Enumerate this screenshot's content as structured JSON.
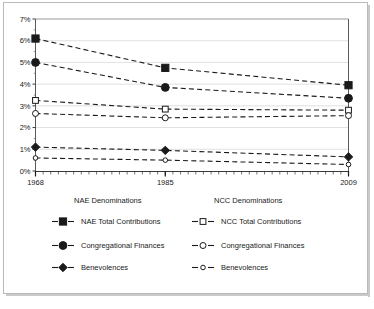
{
  "chart_data": {
    "type": "line",
    "title": "",
    "subtitle": "",
    "xlabel": "",
    "ylabel": "",
    "x": [
      1968,
      1985,
      2009
    ],
    "xtick_labels": [
      "1968",
      "1985",
      "2009"
    ],
    "xlim": [
      1968,
      2009
    ],
    "ylim": [
      0,
      7
    ],
    "ytick_labels": [
      "0%",
      "1%",
      "2%",
      "3%",
      "4%",
      "5%",
      "6%",
      "7%"
    ],
    "ytick_values": [
      0,
      1,
      2,
      3,
      4,
      5,
      6,
      7
    ],
    "grid": true,
    "grid_axis": "y",
    "legend_position": "below",
    "minor_ticks_x": "annual",
    "series": [
      {
        "name": "NAE Total Contributions",
        "group": "NAE Denominations",
        "marker": "filled-square",
        "linestyle": "dashed",
        "color": "#1a1a1a",
        "values": [
          6.1,
          4.75,
          3.95
        ]
      },
      {
        "name": "Congregational Finances",
        "group": "NAE Denominations",
        "marker": "filled-circle",
        "linestyle": "dashed",
        "color": "#1a1a1a",
        "values": [
          5.0,
          3.85,
          3.35
        ]
      },
      {
        "name": "Benevolences",
        "group": "NAE Denominations",
        "marker": "filled-diamond",
        "linestyle": "dashed",
        "color": "#1a1a1a",
        "values": [
          1.1,
          0.95,
          0.65
        ]
      },
      {
        "name": "NCC Total Contributions",
        "group": "NCC Denominations",
        "marker": "open-square",
        "linestyle": "dashed",
        "color": "#1a1a1a",
        "values": [
          3.25,
          2.85,
          2.8
        ]
      },
      {
        "name": "Congregational Finances",
        "group": "NCC Denominations",
        "marker": "open-circle",
        "linestyle": "dashed",
        "color": "#1a1a1a",
        "values": [
          2.65,
          2.45,
          2.55
        ]
      },
      {
        "name": "Benevolences",
        "group": "NCC Denominations",
        "marker": "open-circle-small",
        "linestyle": "dashed",
        "color": "#1a1a1a",
        "values": [
          0.6,
          0.5,
          0.3
        ]
      }
    ]
  },
  "legend": {
    "columns": [
      {
        "heading": "NAE Denominations",
        "entries": [
          {
            "label": "NAE Total Contributions",
            "marker": "filled-square"
          },
          {
            "label": "Congregational Finances",
            "marker": "filled-circle"
          },
          {
            "label": "Benevolences",
            "marker": "filled-diamond"
          }
        ]
      },
      {
        "heading": "NCC Denominations",
        "entries": [
          {
            "label": "NCC Total Contributions",
            "marker": "open-square"
          },
          {
            "label": "Congregational Finances",
            "marker": "open-circle"
          },
          {
            "label": "Benevolences",
            "marker": "open-circle-small"
          }
        ]
      }
    ]
  },
  "caption": {
    "left": "",
    "right": ""
  }
}
